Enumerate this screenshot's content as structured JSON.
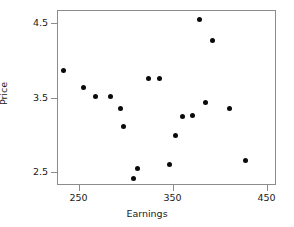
{
  "chart_data": {
    "type": "scatter",
    "title": "",
    "xlabel": "Earnings",
    "ylabel": "Price",
    "xlim": [
      227,
      460
    ],
    "ylim": [
      2.33,
      4.67
    ],
    "xticks": [
      250,
      350,
      450
    ],
    "yticks": [
      4.5,
      3.5,
      2.5
    ],
    "xtick_labels": [
      "250",
      "350",
      "450"
    ],
    "ytick_labels": [
      "4.5",
      "3.5",
      "2.5"
    ],
    "grid": false,
    "legend": null,
    "marker": {
      "shape": "circle",
      "color": "#0a0a0a",
      "size": 5
    },
    "points": [
      {
        "x": 233,
        "y": 3.88
      },
      {
        "x": 254,
        "y": 3.65
      },
      {
        "x": 267,
        "y": 3.53
      },
      {
        "x": 283,
        "y": 3.53
      },
      {
        "x": 293,
        "y": 3.36
      },
      {
        "x": 297,
        "y": 3.13
      },
      {
        "x": 307,
        "y": 2.43
      },
      {
        "x": 312,
        "y": 2.57
      },
      {
        "x": 323,
        "y": 3.77
      },
      {
        "x": 335,
        "y": 3.77
      },
      {
        "x": 346,
        "y": 2.62
      },
      {
        "x": 352,
        "y": 3.0
      },
      {
        "x": 359,
        "y": 3.26
      },
      {
        "x": 370,
        "y": 3.27
      },
      {
        "x": 378,
        "y": 4.55
      },
      {
        "x": 384,
        "y": 3.44
      },
      {
        "x": 391,
        "y": 4.28
      },
      {
        "x": 409,
        "y": 3.36
      },
      {
        "x": 427,
        "y": 2.67
      }
    ]
  },
  "axes": {
    "frame_color": "#8c8c8c"
  }
}
